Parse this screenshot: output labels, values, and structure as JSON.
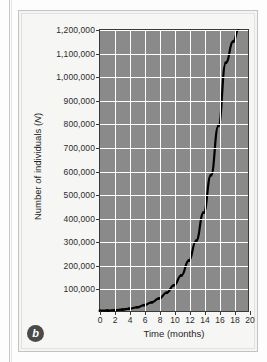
{
  "figure": {
    "panel_letter": "b",
    "background_color": "#f6f6f4",
    "plot_background_color": "#8a8a8a",
    "grid_color": "#ffffff",
    "curve_color": "#000000"
  },
  "chart_data": {
    "type": "line",
    "title": "",
    "xlabel": "Time (months)",
    "ylabel": "Number of individuals (N)",
    "xlim": [
      0,
      20
    ],
    "ylim": [
      0,
      1200000
    ],
    "grid": true,
    "legend": "none",
    "xticks": [
      "0",
      "2",
      "4",
      "6",
      "8",
      "10",
      "12",
      "14",
      "16",
      "18",
      "20"
    ],
    "xtick_values": [
      0,
      2,
      4,
      6,
      8,
      10,
      12,
      14,
      16,
      18,
      20
    ],
    "yticks": [
      "100,000",
      "200,000",
      "300,000",
      "400,000",
      "500,000",
      "600,000",
      "700,000",
      "800,000",
      "900,000",
      "1,000,000",
      "1,100,000",
      "1,200,000"
    ],
    "ytick_values": [
      100000,
      200000,
      300000,
      400000,
      500000,
      600000,
      700000,
      800000,
      900000,
      1000000,
      1100000,
      1200000
    ],
    "series": [
      {
        "name": "Exponential growth",
        "marker": "dot",
        "x": [
          0,
          1,
          2,
          3,
          4,
          5,
          6,
          7,
          8,
          9,
          10,
          11,
          12,
          13,
          14,
          15,
          16,
          17,
          18,
          18.7
        ],
        "values": [
          1000,
          2000,
          3500,
          6000,
          10000,
          16000,
          25000,
          37000,
          54000,
          78000,
          110000,
          152000,
          215000,
          300000,
          420000,
          580000,
          790000,
          1060000,
          1150000,
          1200000
        ]
      }
    ]
  }
}
